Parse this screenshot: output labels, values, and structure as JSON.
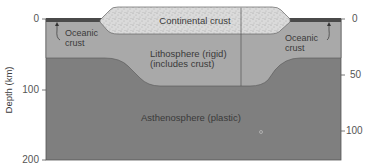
{
  "figure": {
    "left_axis": {
      "title": "Depth (km)",
      "ticks": [
        {
          "label": "0",
          "y": 19
        },
        {
          "label": "100",
          "y": 90
        },
        {
          "label": "200",
          "y": 160
        }
      ]
    },
    "right_axis": {
      "ticks": [
        {
          "label": "0",
          "y": 19
        },
        {
          "label": "50",
          "y": 75
        },
        {
          "label": "100",
          "y": 131
        }
      ]
    },
    "labels": {
      "continental_crust": "Continental crust",
      "oceanic_crust_left_line1": "Oceanic",
      "oceanic_crust_left_line2": "crust",
      "oceanic_crust_right_line1": "Oceanic",
      "oceanic_crust_right_line2": "crust",
      "lithosphere_line1": "Lithosphere (rigid)",
      "lithosphere_line2": "(includes crust)",
      "asthenosphere": "Asthenosphere (plastic)"
    },
    "colors": {
      "asthenosphere": "#7f7f7f",
      "lithosphere": "#a9a9a9",
      "continental_crust": "#d9d9d9",
      "oceanic_crust": "#4a4a4a",
      "outline": "#555555"
    }
  }
}
